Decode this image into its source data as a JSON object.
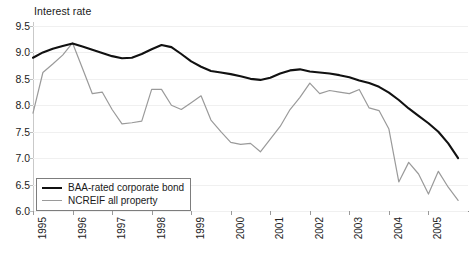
{
  "chart_data": {
    "type": "line",
    "title": "Interest rate",
    "xlabel": "",
    "ylabel": "Interest rate",
    "ylim": [
      6.0,
      9.5
    ],
    "xlim": [
      1995.0,
      2006.0
    ],
    "grid": true,
    "legend_position": "bottom-left",
    "yticks": [
      "6.0",
      "6.5",
      "7.0",
      "7.5",
      "8.0",
      "8.5",
      "9.0",
      "9.5"
    ],
    "ytick_values": [
      6.0,
      6.5,
      7.0,
      7.5,
      8.0,
      8.5,
      9.0,
      9.5
    ],
    "categories": [
      "1995",
      "1996",
      "1997",
      "1998",
      "1999",
      "2000",
      "2001",
      "2002",
      "2003",
      "2004",
      "2005"
    ],
    "xtick_values": [
      1995,
      1996,
      1997,
      1998,
      1999,
      2000,
      2001,
      2002,
      2003,
      2004,
      2005
    ],
    "series": [
      {
        "name": "BAA-rated corporate bond",
        "color": "#111111",
        "width": 2.1,
        "x": [
          1995.0,
          1995.25,
          1995.5,
          1995.75,
          1996.0,
          1996.25,
          1996.5,
          1996.75,
          1997.0,
          1997.25,
          1997.5,
          1997.75,
          1998.0,
          1998.25,
          1998.5,
          1998.75,
          1999.0,
          1999.25,
          1999.5,
          1999.75,
          2000.0,
          2000.25,
          2000.5,
          2000.75,
          2001.0,
          2001.25,
          2001.5,
          2001.75,
          2002.0,
          2002.25,
          2002.5,
          2002.75,
          2003.0,
          2003.25,
          2003.5,
          2003.75,
          2004.0,
          2004.25,
          2004.5,
          2004.75,
          2005.0,
          2005.25,
          2005.5,
          2005.75
        ],
        "values": [
          8.9,
          9.0,
          9.07,
          9.12,
          9.17,
          9.11,
          9.05,
          8.99,
          8.93,
          8.89,
          8.9,
          8.97,
          9.06,
          9.14,
          9.1,
          8.97,
          8.83,
          8.73,
          8.65,
          8.62,
          8.59,
          8.55,
          8.5,
          8.48,
          8.52,
          8.6,
          8.66,
          8.68,
          8.64,
          8.62,
          8.6,
          8.57,
          8.53,
          8.47,
          8.42,
          8.35,
          8.24,
          8.1,
          7.94,
          7.8,
          7.66,
          7.5,
          7.28,
          7.0
        ]
      },
      {
        "name": "NCREIF all property",
        "color": "#9a9a9a",
        "width": 1.2,
        "x": [
          1995.0,
          1995.25,
          1995.5,
          1995.75,
          1996.0,
          1996.25,
          1996.5,
          1996.75,
          1997.0,
          1997.25,
          1997.5,
          1997.75,
          1998.0,
          1998.25,
          1998.5,
          1998.75,
          1999.0,
          1999.25,
          1999.5,
          1999.75,
          2000.0,
          2000.25,
          2000.5,
          2000.75,
          2001.0,
          2001.25,
          2001.5,
          2001.75,
          2002.0,
          2002.25,
          2002.5,
          2002.75,
          2003.0,
          2003.25,
          2003.5,
          2003.75,
          2004.0,
          2004.25,
          2004.5,
          2004.75,
          2005.0,
          2005.25,
          2005.5,
          2005.75
        ],
        "values": [
          7.85,
          8.62,
          8.78,
          8.95,
          9.18,
          8.7,
          8.22,
          8.25,
          7.92,
          7.65,
          7.67,
          7.7,
          8.3,
          8.3,
          8.0,
          7.92,
          8.05,
          8.18,
          7.72,
          7.5,
          7.3,
          7.26,
          7.28,
          7.12,
          7.36,
          7.6,
          7.92,
          8.15,
          8.42,
          8.22,
          8.28,
          8.25,
          8.22,
          8.3,
          7.95,
          7.9,
          7.55,
          6.55,
          6.92,
          6.7,
          6.32,
          6.75,
          6.45,
          6.2
        ]
      }
    ],
    "legend": [
      {
        "label": "BAA-rated corporate bond",
        "color": "#111111"
      },
      {
        "label": "NCREIF all property",
        "color": "#9a9a9a"
      }
    ]
  }
}
